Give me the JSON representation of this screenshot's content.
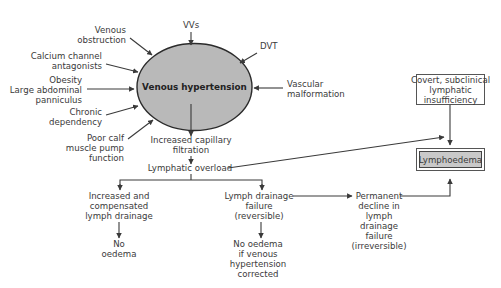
{
  "diagram": {
    "center": {
      "label": "Venous hypertension",
      "fill": "#b9b9b9",
      "stroke": "#2b2b2b"
    },
    "causes": [
      {
        "id": "vvs",
        "lines": [
          "VVs"
        ]
      },
      {
        "id": "dvt",
        "lines": [
          "DVT"
        ]
      },
      {
        "id": "venous-obstruction",
        "lines": [
          "Venous",
          "obstruction"
        ]
      },
      {
        "id": "calcium-channel",
        "lines": [
          "Calcium channel",
          "antagonists"
        ]
      },
      {
        "id": "obesity",
        "lines": [
          "Obesity",
          "Large abdominal",
          "panniculus"
        ]
      },
      {
        "id": "chronic-dependency",
        "lines": [
          "Chronic",
          "dependency"
        ]
      },
      {
        "id": "poor-calf",
        "lines": [
          "Poor calf",
          "muscle pump",
          "function"
        ]
      },
      {
        "id": "vascular-malformation",
        "lines": [
          "Vascular",
          "malformation"
        ]
      }
    ],
    "flow": {
      "increased_filtration": [
        "Increased capillary",
        "filtration"
      ],
      "lymphatic_overload": "Lymphatic overload",
      "compensated": [
        "Increased and",
        "compensated",
        "lymph drainage"
      ],
      "no_oedema": [
        "No",
        "oedema"
      ],
      "drainage_failure": [
        "Lymph drainage",
        "failure",
        "(reversible)"
      ],
      "no_oedema_if": [
        "No oedema",
        "if venous",
        "hypertension",
        "corrected"
      ],
      "permanent_decline": [
        "Permanent",
        "decline in",
        "lymph",
        "drainage",
        "failure",
        "(irreversible)"
      ]
    },
    "covert_box": {
      "lines": [
        "Covert, subclinical",
        "lymphatic",
        "insufficiency"
      ]
    },
    "outcome_box": {
      "label": "Lymphoedema",
      "fill": "#c9c9c9"
    }
  }
}
